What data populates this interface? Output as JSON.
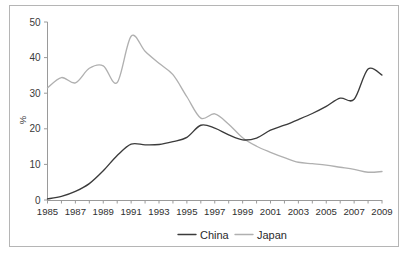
{
  "figure": {
    "background_color": "#ffffff",
    "border_color": "#b5b5b5"
  },
  "chart_data": {
    "type": "line",
    "title": "",
    "xlabel": "",
    "ylabel": "%",
    "ylim": [
      0,
      50
    ],
    "xlim": [
      1985,
      2009
    ],
    "grid": false,
    "legend_position": "bottom",
    "y_ticks": [
      "0",
      "10",
      "20",
      "30",
      "40",
      "50"
    ],
    "y_tick_values": [
      0,
      10,
      20,
      30,
      40,
      50
    ],
    "x_ticks": [
      "1985",
      "1987",
      "1989",
      "1991",
      "1993",
      "1995",
      "1997",
      "1999",
      "2001",
      "2003",
      "2005",
      "2007",
      "2009"
    ],
    "x_tick_values": [
      1985,
      1987,
      1989,
      1991,
      1993,
      1995,
      1997,
      1999,
      2001,
      2003,
      2005,
      2007,
      2009
    ],
    "x": [
      1985,
      1986,
      1987,
      1988,
      1989,
      1990,
      1991,
      1992,
      1993,
      1994,
      1995,
      1996,
      1997,
      1998,
      1999,
      2000,
      2001,
      2002,
      2003,
      2004,
      2005,
      2006,
      2007,
      2008,
      2009
    ],
    "series": [
      {
        "name": "China",
        "color": "#3b3b3b",
        "values": [
          0.3,
          1.0,
          2.4,
          4.6,
          8.2,
          12.5,
          15.7,
          15.5,
          15.6,
          16.4,
          17.6,
          21.0,
          20.2,
          18.3,
          16.9,
          17.4,
          19.6,
          21.0,
          22.6,
          24.3,
          26.3,
          28.6,
          28.3,
          36.8,
          35.1
        ]
      },
      {
        "name": "Japan",
        "color": "#b0b0b0",
        "values": [
          31.5,
          34.4,
          32.9,
          37.0,
          37.7,
          33.0,
          46.0,
          41.8,
          38.4,
          35.2,
          29.0,
          23.0,
          24.2,
          21.3,
          17.5,
          15.1,
          13.4,
          11.9,
          10.6,
          10.2,
          9.8,
          9.2,
          8.6,
          7.8,
          8.0
        ]
      }
    ],
    "legend": [
      {
        "label": "China",
        "color": "#3b3b3b"
      },
      {
        "label": "Japan",
        "color": "#b0b0b0"
      }
    ]
  }
}
